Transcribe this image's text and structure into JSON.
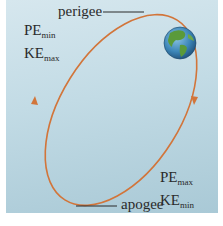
{
  "diagram": {
    "type": "elliptical-orbit",
    "labels": {
      "perigee": "perigee",
      "apogee": "apogee"
    },
    "perigee_energy": {
      "pe_base": "PE",
      "pe_sub": "min",
      "ke_base": "KE",
      "ke_sub": "max"
    },
    "apogee_energy": {
      "pe_base": "PE",
      "pe_sub": "max",
      "ke_base": "KE",
      "ke_sub": "min"
    },
    "body": "earth-globe",
    "colors": {
      "orbit": "#d2753a",
      "background_top": "#d6e7ee",
      "background_bottom": "#a9c9d6",
      "ocean": "#3c86b8",
      "land": "#5a9a3a",
      "text": "#2a2a2a"
    }
  }
}
